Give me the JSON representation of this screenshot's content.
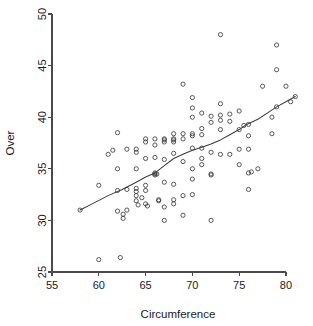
{
  "chart_data": {
    "type": "scatter",
    "title": "",
    "xlabel": "Circumference",
    "ylabel": "Over",
    "xlim": [
      55,
      81.5
    ],
    "ylim": [
      25,
      50
    ],
    "xticks": [
      55,
      60,
      65,
      70,
      75,
      80
    ],
    "xtick_labels": [
      "55",
      "60",
      "65",
      "70",
      "75",
      "80"
    ],
    "yticks": [
      25,
      30,
      35,
      40,
      45,
      50
    ],
    "ytick_labels": [
      "25",
      "30",
      "35",
      "40",
      "45",
      "50"
    ],
    "grid": false,
    "legend": "none",
    "marker": "open-circle",
    "marker_color": "#3c3c3c",
    "line_color": "#3c3c3c",
    "axis_color": "#4a4a4a",
    "background": "#ffffff",
    "points": [
      [
        58.0,
        31.0
      ],
      [
        60.0,
        33.4
      ],
      [
        60.0,
        26.2
      ],
      [
        61.0,
        36.4
      ],
      [
        61.5,
        36.8
      ],
      [
        62.0,
        38.5
      ],
      [
        62.0,
        35.0
      ],
      [
        62.0,
        32.9
      ],
      [
        62.0,
        30.9
      ],
      [
        62.3,
        26.4
      ],
      [
        62.6,
        30.6
      ],
      [
        62.6,
        30.2
      ],
      [
        63.0,
        36.9
      ],
      [
        63.0,
        33.0
      ],
      [
        63.0,
        31.0
      ],
      [
        64.0,
        36.9
      ],
      [
        64.0,
        36.6
      ],
      [
        64.0,
        35.0
      ],
      [
        64.0,
        33.1
      ],
      [
        64.0,
        32.8
      ],
      [
        64.0,
        32.4
      ],
      [
        64.0,
        31.9
      ],
      [
        64.2,
        31.5
      ],
      [
        64.6,
        32.2
      ],
      [
        65.0,
        37.9
      ],
      [
        65.0,
        37.6
      ],
      [
        65.0,
        36.0
      ],
      [
        65.0,
        33.4
      ],
      [
        65.0,
        32.9
      ],
      [
        65.0,
        31.6
      ],
      [
        65.2,
        31.4
      ],
      [
        66.0,
        37.9
      ],
      [
        66.0,
        37.3
      ],
      [
        66.0,
        36.1
      ],
      [
        66.0,
        34.6
      ],
      [
        66.0,
        34.5
      ],
      [
        66.0,
        34.4
      ],
      [
        66.2,
        34.5
      ],
      [
        66.4,
        32.0
      ],
      [
        66.4,
        31.9
      ],
      [
        67.0,
        37.9
      ],
      [
        67.0,
        37.8
      ],
      [
        67.0,
        37.6
      ],
      [
        67.0,
        35.9
      ],
      [
        67.0,
        33.7
      ],
      [
        67.0,
        31.3
      ],
      [
        67.0,
        30.0
      ],
      [
        68.0,
        38.4
      ],
      [
        68.0,
        37.9
      ],
      [
        68.0,
        37.8
      ],
      [
        68.0,
        37.6
      ],
      [
        68.0,
        36.5
      ],
      [
        68.0,
        33.5
      ],
      [
        68.0,
        32.0
      ],
      [
        68.0,
        31.6
      ],
      [
        69.0,
        43.2
      ],
      [
        69.0,
        38.4
      ],
      [
        69.0,
        37.9
      ],
      [
        69.0,
        35.7
      ],
      [
        69.0,
        32.4
      ],
      [
        69.0,
        30.5
      ],
      [
        70.0,
        41.9
      ],
      [
        70.0,
        40.9
      ],
      [
        70.0,
        40.0
      ],
      [
        70.0,
        38.4
      ],
      [
        70.0,
        38.2
      ],
      [
        70.0,
        37.0
      ],
      [
        70.0,
        35.0
      ],
      [
        70.0,
        34.0
      ],
      [
        70.0,
        32.5
      ],
      [
        71.0,
        40.4
      ],
      [
        71.0,
        38.9
      ],
      [
        71.0,
        38.3
      ],
      [
        71.0,
        37.0
      ],
      [
        71.0,
        36.0
      ],
      [
        71.0,
        35.4
      ],
      [
        72.0,
        40.1
      ],
      [
        72.0,
        39.5
      ],
      [
        72.0,
        36.6
      ],
      [
        72.0,
        34.5
      ],
      [
        72.0,
        34.4
      ],
      [
        72.0,
        30.0
      ],
      [
        73.0,
        48.0
      ],
      [
        73.0,
        41.3
      ],
      [
        73.0,
        40.2
      ],
      [
        73.0,
        39.7
      ],
      [
        73.0,
        38.8
      ],
      [
        73.0,
        36.4
      ],
      [
        74.0,
        40.3
      ],
      [
        74.0,
        39.6
      ],
      [
        74.0,
        36.4
      ],
      [
        75.0,
        40.6
      ],
      [
        75.0,
        38.8
      ],
      [
        75.0,
        36.9
      ],
      [
        75.0,
        35.4
      ],
      [
        75.5,
        39.2
      ],
      [
        76.0,
        39.3
      ],
      [
        76.0,
        38.2
      ],
      [
        76.0,
        36.9
      ],
      [
        76.0,
        34.6
      ],
      [
        76.0,
        33.0
      ],
      [
        76.3,
        34.7
      ],
      [
        77.0,
        35.0
      ],
      [
        77.5,
        43.0
      ],
      [
        78.5,
        40.0
      ],
      [
        78.5,
        38.4
      ],
      [
        79.0,
        47.0
      ],
      [
        79.0,
        44.6
      ],
      [
        79.0,
        41.0
      ],
      [
        80.0,
        43.0
      ],
      [
        80.5,
        41.5
      ],
      [
        81.0,
        42.0
      ]
    ],
    "trend_line": {
      "name": "smoothed-fit",
      "points": [
        [
          58.0,
          31.0
        ],
        [
          59.5,
          31.7
        ],
        [
          61.0,
          32.4
        ],
        [
          62.5,
          33.0
        ],
        [
          64.0,
          33.7
        ],
        [
          65.0,
          34.2
        ],
        [
          66.0,
          34.6
        ],
        [
          67.0,
          35.3
        ],
        [
          68.0,
          36.0
        ],
        [
          69.0,
          36.4
        ],
        [
          70.0,
          36.8
        ],
        [
          71.0,
          37.1
        ],
        [
          72.0,
          37.4
        ],
        [
          73.0,
          37.8
        ],
        [
          74.0,
          38.3
        ],
        [
          75.0,
          38.8
        ],
        [
          75.8,
          39.3
        ],
        [
          77.0,
          39.8
        ],
        [
          78.0,
          40.4
        ],
        [
          79.0,
          41.0
        ],
        [
          80.0,
          41.5
        ],
        [
          81.0,
          42.0
        ]
      ]
    }
  }
}
